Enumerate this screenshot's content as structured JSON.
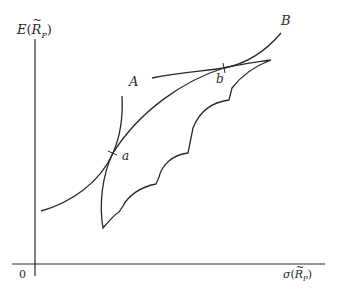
{
  "diagram": {
    "type": "portfolio-efficient-frontier",
    "y_axis": {
      "label_func": "E",
      "label_var": "R",
      "label_sub": "P"
    },
    "x_axis": {
      "label_func": "σ",
      "label_var": "R",
      "label_sub": "P"
    },
    "origin_label": "0",
    "curves": [
      {
        "name": "A",
        "label": "A",
        "role": "indifference-curve-lower"
      },
      {
        "name": "B",
        "label": "B",
        "role": "indifference-curve-upper"
      },
      {
        "name": "feasible-set",
        "role": "opportunity-set"
      }
    ],
    "tangency_points": [
      {
        "label": "a",
        "between": [
          "A",
          "feasible-set"
        ]
      },
      {
        "label": "b",
        "between": [
          "B",
          "feasible-set"
        ]
      }
    ],
    "colors": {
      "line": "#2a2a2a",
      "background": "#ffffff"
    }
  }
}
